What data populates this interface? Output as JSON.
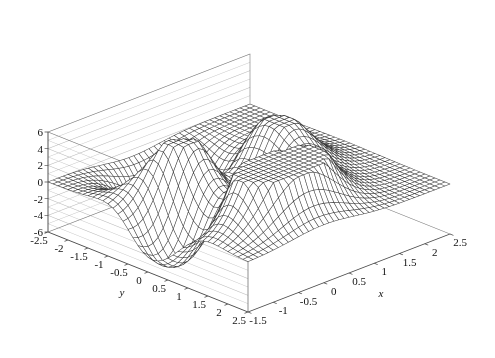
{
  "figure": {
    "width": 495,
    "height": 358,
    "background": "#ffffff",
    "kind": "3d-wireframe-surface"
  },
  "style": {
    "mesh_color": "#3a3a3a",
    "wall_grid_color": "#b8b8b8",
    "box_edge_color": "#7a7a7a",
    "axis_line_color": "#4a4a4a",
    "tick_color": "#4a4a4a",
    "text_color": "#111111"
  },
  "chart_data": {
    "type": "surface",
    "title": "",
    "xlabel": "x",
    "ylabel": "y",
    "zlabel": "",
    "grid": true,
    "legend": "none",
    "xlim": [
      -1.5,
      2.5
    ],
    "ylim": [
      -2.5,
      2.5
    ],
    "zlim": [
      -6,
      6
    ],
    "xticks": [
      -1.5,
      -1,
      -0.5,
      0,
      0.5,
      1,
      1.5,
      2,
      2.5
    ],
    "xticklabels": [
      "-1.5",
      "-1",
      "-0.5",
      "0",
      "0.5",
      "1",
      "1.5",
      "2",
      "2.5"
    ],
    "yticks": [
      -2.5,
      -2,
      -1.5,
      -1,
      -0.5,
      0,
      0.5,
      1,
      1.5,
      2,
      2.5
    ],
    "yticklabels": [
      "-2.5",
      "-2",
      "-1.5",
      "-1",
      "-0.5",
      "0",
      "0.5",
      "1",
      "1.5",
      "2",
      "2.5"
    ],
    "zticks": [
      -6,
      -4,
      -2,
      0,
      2,
      4,
      6
    ],
    "zticklabels": [
      "-6",
      "-4",
      "-2",
      "0",
      "2",
      "4",
      "6"
    ],
    "surface": {
      "formula": "peaks",
      "description": "Two broad flat-topped plateaus clipped at z=+6 with a deep flat-bottomed trough clipped at z=-6 between them",
      "clip_min": -6,
      "clip_max": 6,
      "grid_nx": 41,
      "grid_ny": 41,
      "sample_z_grid_9x9": [
        [
          0.0,
          0.0,
          0.1,
          0.2,
          0.2,
          0.1,
          0.0,
          0.0,
          0.0
        ],
        [
          0.1,
          0.4,
          1.2,
          2.0,
          1.8,
          0.8,
          0.2,
          0.0,
          0.0
        ],
        [
          0.3,
          1.6,
          4.6,
          6.0,
          5.2,
          2.4,
          0.5,
          0.1,
          0.0
        ],
        [
          0.2,
          1.4,
          4.8,
          6.0,
          4.0,
          0.4,
          -1.2,
          -0.5,
          -0.1
        ],
        [
          -0.1,
          -0.4,
          0.6,
          1.4,
          -1.0,
          -5.2,
          -4.4,
          -1.2,
          -0.2
        ],
        [
          -0.3,
          -1.4,
          -2.6,
          -2.0,
          -4.6,
          -6.0,
          -5.0,
          -1.6,
          -0.2
        ],
        [
          -0.2,
          -0.8,
          -1.4,
          -0.6,
          -2.0,
          -3.2,
          -2.0,
          -0.6,
          -0.1
        ],
        [
          -0.1,
          -0.2,
          -0.4,
          -0.2,
          -0.5,
          -0.8,
          -0.5,
          -0.1,
          0.0
        ],
        [
          0.0,
          0.0,
          -0.1,
          0.0,
          -0.1,
          -0.1,
          -0.1,
          0.0,
          0.0
        ]
      ]
    },
    "view": {
      "azimuth_deg": -37,
      "elevation_deg": 22,
      "projection": "orthographic"
    }
  },
  "axes": {
    "x": {
      "title": "x",
      "ticks": [
        {
          "value": -1.5,
          "label": "-1.5"
        },
        {
          "value": -1,
          "label": "-1"
        },
        {
          "value": -0.5,
          "label": "-0.5"
        },
        {
          "value": 0,
          "label": "0"
        },
        {
          "value": 0.5,
          "label": "0.5"
        },
        {
          "value": 1,
          "label": "1"
        },
        {
          "value": 1.5,
          "label": "1.5"
        },
        {
          "value": 2,
          "label": "2"
        },
        {
          "value": 2.5,
          "label": "2.5"
        }
      ]
    },
    "y": {
      "title": "y",
      "ticks": [
        {
          "value": -2.5,
          "label": "-2.5"
        },
        {
          "value": -2,
          "label": "-2"
        },
        {
          "value": -1.5,
          "label": "-1.5"
        },
        {
          "value": -1,
          "label": "-1"
        },
        {
          "value": -0.5,
          "label": "-0.5"
        },
        {
          "value": 0,
          "label": "0"
        },
        {
          "value": 0.5,
          "label": "0.5"
        },
        {
          "value": 1,
          "label": "1"
        },
        {
          "value": 1.5,
          "label": "1.5"
        },
        {
          "value": 2,
          "label": "2"
        },
        {
          "value": 2.5,
          "label": "2.5"
        }
      ]
    },
    "z": {
      "title": "",
      "ticks": [
        {
          "value": 6,
          "label": "6"
        },
        {
          "value": 4,
          "label": "4"
        },
        {
          "value": 2,
          "label": "2"
        },
        {
          "value": 0,
          "label": "0"
        },
        {
          "value": -2,
          "label": "-2"
        },
        {
          "value": -4,
          "label": "-4"
        },
        {
          "value": -6,
          "label": "-6"
        }
      ]
    }
  }
}
